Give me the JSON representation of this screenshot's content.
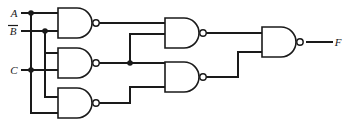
{
  "diagram": {
    "type": "logic-circuit",
    "background_color": "#ffffff",
    "line_color": "#1a1a1a"
  },
  "inputs": [
    {
      "id": "A",
      "label": "A",
      "negated": false,
      "x": 14,
      "y": 17
    },
    {
      "id": "Bn",
      "label": "B",
      "negated": true,
      "x": 12,
      "y": 35
    },
    {
      "id": "C",
      "label": "C",
      "negated": false,
      "x": 14,
      "y": 74
    }
  ],
  "outputs": [
    {
      "id": "F",
      "label": "F",
      "x": 332,
      "y": 46
    }
  ],
  "gates": [
    {
      "id": "g1",
      "type": "NAND",
      "inputs": [
        "A",
        "Bn"
      ],
      "x": 58,
      "y": 8,
      "w": 38,
      "h": 30
    },
    {
      "id": "g2",
      "type": "NAND",
      "inputs": [
        "Bn",
        "C"
      ],
      "x": 58,
      "y": 48,
      "w": 38,
      "h": 30
    },
    {
      "id": "g3",
      "type": "NAND",
      "inputs": [
        "C",
        "A"
      ],
      "x": 58,
      "y": 88,
      "w": 38,
      "h": 30
    },
    {
      "id": "g4",
      "type": "NAND",
      "inputs": [
        "g1",
        "g2"
      ],
      "x": 165,
      "y": 18,
      "w": 38,
      "h": 30
    },
    {
      "id": "g5",
      "type": "NAND",
      "inputs": [
        "g2",
        "g3"
      ],
      "x": 165,
      "y": 62,
      "w": 38,
      "h": 30
    },
    {
      "id": "g6",
      "type": "NAND",
      "inputs": [
        "g4",
        "g5"
      ],
      "x": 262,
      "y": 27,
      "w": 38,
      "h": 30
    }
  ],
  "junctions": [
    {
      "id": "j-a",
      "x": 31,
      "y": 13
    },
    {
      "id": "j-bn",
      "x": 45,
      "y": 31
    },
    {
      "id": "j-c",
      "x": 31,
      "y": 70
    },
    {
      "id": "j-g2",
      "x": 130,
      "y": 62
    }
  ],
  "wires": {
    "a_stub": "M 22 13 L 31 13",
    "a_to_g1": "M 31 13 L 58 13",
    "a_bus_down": "M 31 13 L 31 113",
    "a_to_g3_low": "M 31 113 L 58 113",
    "bn_stub": "M 22 31 L 45 31",
    "bn_to_g1": "M 45 31 L 58 31",
    "bn_bus_down": "M 45 31 L 45 97",
    "bn_to_g2": "M 45 53 L 58 53",
    "bn_to_g3": "M 45 97 L 58 97",
    "c_stub": "M 22 70 L 31 70",
    "c_to_g2": "M 31 70 L 58 70",
    "g1_out": "M 100 23 L 165 23",
    "g2_out": "M 100 63 L 130 63",
    "g2_to_g4_up": "M 130 62 L 130 34",
    "g2_to_g4_in": "M 130 34 L 165 34",
    "g2_to_g5": "M 130 63 L 165 67",
    "g3_out": "M 100 103 L 130 103",
    "g3_up": "M 130 103 L 130 87",
    "g3_to_g5": "M 130 87 L 165 87",
    "g4_out": "M 207 33 L 262 33",
    "g5_out": "M 207 77 L 238 77",
    "g5_up": "M 238 77 L 238 52",
    "g5_to_g6": "M 238 52 L 262 52",
    "f_out": "M 307 42 L 332 42"
  }
}
